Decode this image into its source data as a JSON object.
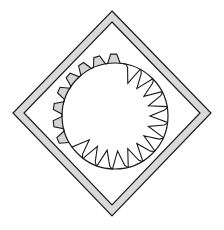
{
  "diagram": {
    "title": "",
    "width": 224,
    "height": 230,
    "colors": {
      "background": "#ffffff",
      "stroke": "#1a1a1a",
      "frame_fill": "#d9d9d9",
      "tooth_fill": "#d4d4d4"
    },
    "frame": {
      "outer": [
        [
          112,
          11
        ],
        [
          211,
          113
        ],
        [
          112,
          216
        ],
        [
          13,
          113
        ]
      ],
      "inner": [
        [
          112,
          22
        ],
        [
          200,
          113
        ],
        [
          112,
          205
        ],
        [
          24,
          113
        ]
      ]
    },
    "circle": {
      "cx": 115,
      "cy": 116,
      "r": 53
    },
    "gear": {
      "description": "Toothed ring: external trapezoidal teeth (shaded) on the upper-left arc, internal pointed teeth on the lower-right arc",
      "external_teeth": {
        "start_deg": 150,
        "end_deg": 278,
        "count": 8,
        "tip_radius": 62
      },
      "internal_teeth": {
        "start_deg": 282,
        "end_deg": 505,
        "count": 13,
        "tip_radius": 35
      }
    }
  }
}
